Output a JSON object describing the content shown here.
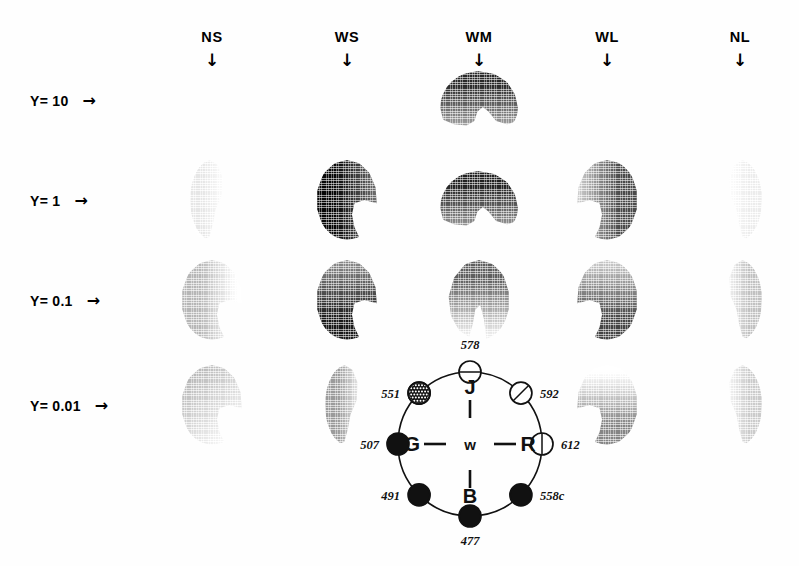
{
  "figure": {
    "background_color": "#fefefe",
    "ink_color": "#111111"
  },
  "columns": [
    {
      "label": "NS",
      "arrow": "↓",
      "x": 212
    },
    {
      "label": "WS",
      "arrow": "↓",
      "x": 347
    },
    {
      "label": "WM",
      "arrow": "↓",
      "x": 479
    },
    {
      "label": "WL",
      "arrow": "↓",
      "x": 607
    },
    {
      "label": "NL",
      "arrow": "↓",
      "x": 740
    }
  ],
  "rows": [
    {
      "label": "Y= 10",
      "arrow": "→",
      "y": 100
    },
    {
      "label": "Y= 1",
      "arrow": "→",
      "y": 200
    },
    {
      "label": "Y= 0.1",
      "arrow": "→",
      "y": 300
    },
    {
      "label": "Y= 0.01",
      "arrow": "→",
      "y": 405
    }
  ],
  "chart_data": {
    "type": "heatmap",
    "title": "",
    "xlabel": "",
    "ylabel": "",
    "x_categories": [
      "NS",
      "WS",
      "WM",
      "WL",
      "NL"
    ],
    "y_categories": [
      "Y= 10",
      "Y= 1",
      "Y= 0.1",
      "Y= 0.01"
    ],
    "grid": false,
    "legend": "none",
    "note": "Each grid cell shows a gamut/chromaticity blob rendered as a halftone-shaded disc with a wedge notch; darkness encodes density.",
    "cells": [
      {
        "row": "Y= 10",
        "col": "NS",
        "present": false,
        "darkness": null,
        "shape": "none"
      },
      {
        "row": "Y= 10",
        "col": "WS",
        "present": false,
        "darkness": null,
        "shape": "none"
      },
      {
        "row": "Y= 10",
        "col": "WM",
        "present": true,
        "darkness": 0.82,
        "shape": "upper-dome",
        "gradient": "top-dark"
      },
      {
        "row": "Y= 10",
        "col": "WL",
        "present": false,
        "darkness": null,
        "shape": "none"
      },
      {
        "row": "Y= 10",
        "col": "NL",
        "present": false,
        "darkness": null,
        "shape": "none"
      },
      {
        "row": "Y= 1",
        "col": "NS",
        "present": true,
        "darkness": 0.12,
        "shape": "crescent",
        "gradient": "left-dark"
      },
      {
        "row": "Y= 1",
        "col": "WS",
        "present": true,
        "darkness": 0.95,
        "shape": "notch-disc",
        "gradient": "left-dark"
      },
      {
        "row": "Y= 1",
        "col": "WM",
        "present": true,
        "darkness": 0.85,
        "shape": "upper-dome",
        "gradient": "top-dark"
      },
      {
        "row": "Y= 1",
        "col": "WL",
        "present": true,
        "darkness": 0.7,
        "shape": "notch-disc",
        "gradient": "right-dark"
      },
      {
        "row": "Y= 1",
        "col": "NL",
        "present": true,
        "darkness": 0.1,
        "shape": "crescent",
        "gradient": "right-dark"
      },
      {
        "row": "Y= 0.1",
        "col": "NS",
        "present": true,
        "darkness": 0.3,
        "shape": "notch-disc",
        "gradient": "left-dark"
      },
      {
        "row": "Y= 0.1",
        "col": "WS",
        "present": true,
        "darkness": 0.88,
        "shape": "notch-disc",
        "gradient": "bottom-dark"
      },
      {
        "row": "Y= 0.1",
        "col": "WM",
        "present": true,
        "darkness": 0.62,
        "shape": "notch-disc",
        "gradient": "top-dark"
      },
      {
        "row": "Y= 0.1",
        "col": "WL",
        "present": true,
        "darkness": 0.72,
        "shape": "notch-disc",
        "gradient": "bottom-dark"
      },
      {
        "row": "Y= 0.1",
        "col": "NL",
        "present": true,
        "darkness": 0.26,
        "shape": "crescent",
        "gradient": "right-dark"
      },
      {
        "row": "Y= 0.01",
        "col": "NS",
        "present": true,
        "darkness": 0.34,
        "shape": "notch-disc",
        "gradient": "flat"
      },
      {
        "row": "Y= 0.01",
        "col": "WS",
        "present": true,
        "darkness": 0.4,
        "shape": "crescent",
        "gradient": "left-dark"
      },
      {
        "row": "Y= 0.01",
        "col": "WM",
        "present": false,
        "darkness": null,
        "shape": "none"
      },
      {
        "row": "Y= 0.01",
        "col": "WL",
        "present": true,
        "darkness": 0.48,
        "shape": "notch-disc",
        "gradient": "bottom-dark"
      },
      {
        "row": "Y= 0.01",
        "col": "NL",
        "present": true,
        "darkness": 0.22,
        "shape": "crescent",
        "gradient": "right-dark"
      }
    ]
  },
  "color_circle": {
    "center_label": "w",
    "axis_labels": {
      "top": "J",
      "left": "G",
      "right": "R",
      "bottom": "B"
    },
    "wavelength_nodes": [
      {
        "value": "578",
        "angle_deg": -90,
        "fill": "open",
        "marker": "horizontal-bar",
        "label_pos": "above"
      },
      {
        "value": "592",
        "angle_deg": -45,
        "fill": "open",
        "marker": "diagonal-bar",
        "label_pos": "right"
      },
      {
        "value": "612",
        "angle_deg": 0,
        "fill": "open",
        "marker": "vertical-bar",
        "label_pos": "right"
      },
      {
        "value": "558c",
        "angle_deg": 45,
        "fill": "solid",
        "marker": "none",
        "label_pos": "right"
      },
      {
        "value": "477",
        "angle_deg": 90,
        "fill": "solid",
        "marker": "none",
        "label_pos": "below"
      },
      {
        "value": "491",
        "angle_deg": 135,
        "fill": "solid",
        "marker": "none",
        "label_pos": "left"
      },
      {
        "value": "507",
        "angle_deg": 180,
        "fill": "solid",
        "marker": "none",
        "label_pos": "left"
      },
      {
        "value": "551",
        "angle_deg": -135,
        "fill": "stippled",
        "marker": "none",
        "label_pos": "left"
      }
    ]
  }
}
